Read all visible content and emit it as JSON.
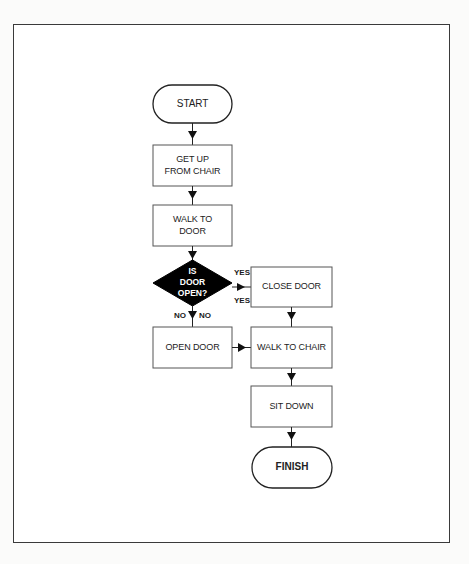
{
  "diagram": {
    "type": "flowchart",
    "nodes": {
      "start": {
        "label": "START",
        "shape": "terminator"
      },
      "get_up": {
        "line1": "GET UP",
        "line2": "FROM CHAIR",
        "shape": "process"
      },
      "walk_to_door": {
        "line1": "WALK TO",
        "line2": "DOOR",
        "shape": "process"
      },
      "decision": {
        "line1": "IS",
        "line2": "DOOR",
        "line3": "OPEN?",
        "shape": "decision",
        "fill": "#000000"
      },
      "close_door": {
        "label": "CLOSE DOOR",
        "shape": "process"
      },
      "open_door": {
        "label": "OPEN DOOR",
        "shape": "process"
      },
      "walk_to_chair": {
        "label": "WALK TO CHAIR",
        "shape": "process"
      },
      "sit_down": {
        "label": "SIT DOWN",
        "shape": "process"
      },
      "finish": {
        "label": "FINISH",
        "shape": "terminator"
      }
    },
    "branch_labels": {
      "yes_top": "YES",
      "yes_bottom": "YES",
      "no_left": "NO",
      "no_right": "NO"
    },
    "edges": [
      {
        "from": "START",
        "to": "GET UP FROM CHAIR"
      },
      {
        "from": "GET UP FROM CHAIR",
        "to": "WALK TO DOOR"
      },
      {
        "from": "WALK TO DOOR",
        "to": "IS DOOR OPEN?"
      },
      {
        "from": "IS DOOR OPEN?",
        "to": "CLOSE DOOR",
        "label": "YES"
      },
      {
        "from": "IS DOOR OPEN?",
        "to": "OPEN DOOR",
        "label": "NO"
      },
      {
        "from": "CLOSE DOOR",
        "to": "WALK TO CHAIR"
      },
      {
        "from": "OPEN DOOR",
        "to": "WALK TO CHAIR"
      },
      {
        "from": "WALK TO CHAIR",
        "to": "SIT DOWN"
      },
      {
        "from": "SIT DOWN",
        "to": "FINISH"
      }
    ]
  }
}
